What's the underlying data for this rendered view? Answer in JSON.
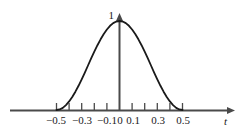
{
  "chart_data": {
    "type": "line",
    "title": "",
    "subtitle": "",
    "xlabel": "t",
    "ylabel": "",
    "grid": false,
    "legend": null,
    "annotations": [
      {
        "name": "y-peak-label",
        "text": "1",
        "x": 0,
        "y": 1
      }
    ],
    "xlim": [
      -0.6,
      0.9
    ],
    "ylim": [
      0,
      1.08
    ],
    "x_ticks": [
      -0.5,
      -0.4,
      -0.3,
      -0.2,
      -0.1,
      0,
      0.1,
      0.2,
      0.3,
      0.4,
      0.5
    ],
    "x_tick_labels": [
      "−0.5",
      "",
      "−0.3",
      "",
      "−0.1",
      "0",
      "0.1",
      "",
      "0.3",
      "",
      "0.5"
    ],
    "y_ticks": [
      1
    ],
    "y_tick_labels": [
      "1"
    ],
    "series": [
      {
        "name": "pulse",
        "color": "#1a1a1a",
        "x": [
          -0.5,
          -0.475,
          -0.45,
          -0.425,
          -0.4,
          -0.375,
          -0.35,
          -0.325,
          -0.3,
          -0.275,
          -0.25,
          -0.225,
          -0.2,
          -0.175,
          -0.15,
          -0.125,
          -0.1,
          -0.075,
          -0.05,
          -0.025,
          0.0,
          0.025,
          0.05,
          0.075,
          0.1,
          0.125,
          0.15,
          0.175,
          0.2,
          0.225,
          0.25,
          0.275,
          0.3,
          0.325,
          0.35,
          0.375,
          0.4,
          0.425,
          0.45,
          0.475,
          0.5
        ],
        "y": [
          0.0,
          0.006,
          0.024,
          0.055,
          0.096,
          0.146,
          0.206,
          0.272,
          0.345,
          0.421,
          0.5,
          0.579,
          0.655,
          0.728,
          0.794,
          0.854,
          0.904,
          0.946,
          0.976,
          0.994,
          1.0,
          0.994,
          0.976,
          0.946,
          0.904,
          0.854,
          0.794,
          0.728,
          0.655,
          0.579,
          0.5,
          0.421,
          0.345,
          0.272,
          0.206,
          0.146,
          0.096,
          0.055,
          0.024,
          0.006,
          0.0
        ]
      }
    ]
  },
  "axes": {
    "x_axis_name": "t",
    "y_axis_arrow": true,
    "x_axis_arrow": true,
    "axis_color": "#4a4a4a",
    "curve_color": "#1a1a1a",
    "background": "#ffffff"
  },
  "labels": {
    "peak": "1",
    "t0": "−0.5",
    "t1": "−0.3",
    "t2": "−0.1",
    "t3": "0",
    "t4": "0.1",
    "t5": "0.3",
    "t6": "0.5",
    "axis_t": "t"
  }
}
